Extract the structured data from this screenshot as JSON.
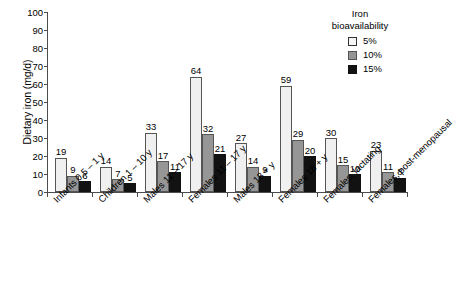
{
  "chart_data": {
    "type": "bar",
    "title": "",
    "xlabel": "",
    "ylabel": "Dietary iron (mg/d)",
    "ylim": [
      0,
      100
    ],
    "ytick_step": 10,
    "yticks": [
      100,
      90,
      80,
      70,
      60,
      50,
      40,
      30,
      20,
      10,
      0
    ],
    "grid": false,
    "legend_position": "top-right",
    "legend_title": "Iron bioavailability",
    "categories": [
      "Infants 0.5 – 1 y",
      "Children 1 – 10 y",
      "Males 11 – 17 y",
      "Females 11 – 17 y",
      "Males 18 + y",
      "Females 18 + y",
      "Females, lactating",
      "Females, post-menopausal"
    ],
    "series": [
      {
        "name": "5%",
        "color": "#f0f0f0",
        "values": [
          19,
          14,
          33,
          64,
          27,
          59,
          30,
          23
        ]
      },
      {
        "name": "10%",
        "color": "#969696",
        "values": [
          9,
          7,
          17,
          32,
          14,
          29,
          15,
          11
        ]
      },
      {
        "name": "15%",
        "color": "#121212",
        "values": [
          6,
          5,
          11,
          21,
          9,
          20,
          10,
          8
        ]
      }
    ]
  },
  "legend": {
    "title_line1": "Iron",
    "title_line2": "bioavailability",
    "entries": [
      {
        "label": "5%"
      },
      {
        "label": "10%"
      },
      {
        "label": "15%"
      }
    ]
  },
  "axes": {
    "y_title": "Dietary iron (mg/d)"
  }
}
